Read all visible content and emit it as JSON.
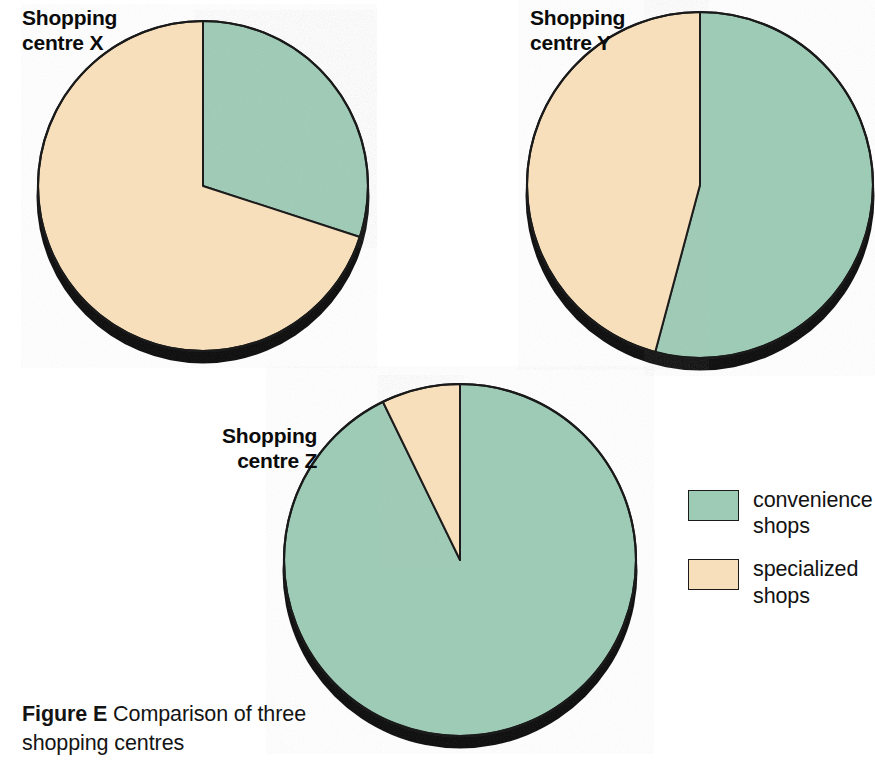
{
  "figure": {
    "caption_bold": "Figure E",
    "caption_rest": "  Comparison of three shopping centres"
  },
  "colors": {
    "convenience": "#9ecbb6",
    "specialized": "#f7dfbb",
    "outline": "#1a1a1a",
    "shadow": "#0a0a0a",
    "background": "#ffffff",
    "text": "#111111"
  },
  "legend": {
    "position": "right",
    "items": [
      {
        "label": "convenience\nshops",
        "color_key": "convenience",
        "swatch_name": "convenience-shops-swatch"
      },
      {
        "label": "specialized\nshops",
        "color_key": "specialized",
        "swatch_name": "specialized-shops-swatch"
      }
    ]
  },
  "charts": {
    "x": {
      "title": "Shopping\ncentre X",
      "cx": 203,
      "cy": 186,
      "r": 165,
      "shadow_dy": 11,
      "slices": [
        {
          "name": "convenience shops",
          "value": 30,
          "color_key": "convenience",
          "start_deg": 0,
          "end_deg": 108
        },
        {
          "name": "specialized shops",
          "value": 70,
          "color_key": "specialized",
          "start_deg": 108,
          "end_deg": 360
        }
      ]
    },
    "y": {
      "title": "Shopping\ncentre Y",
      "cx": 700,
      "cy": 185,
      "r": 173,
      "shadow_dy": 11,
      "slices": [
        {
          "name": "convenience shops",
          "value": 54,
          "color_key": "convenience",
          "start_deg": 0,
          "end_deg": 195
        },
        {
          "name": "specialized shops",
          "value": 46,
          "color_key": "specialized",
          "start_deg": 195,
          "end_deg": 360
        }
      ]
    },
    "z": {
      "title": "Shopping\ncentre Z",
      "cx": 460,
      "cy": 560,
      "r": 176,
      "shadow_dy": 11,
      "slices": [
        {
          "name": "convenience shops",
          "value": 93,
          "color_key": "convenience",
          "start_deg": 0,
          "end_deg": 334
        },
        {
          "name": "specialized shops",
          "value": 7,
          "color_key": "specialized",
          "start_deg": 334,
          "end_deg": 360
        }
      ]
    }
  },
  "chart_data": {
    "type": "pie",
    "title": "Figure E  Comparison of three shopping centres",
    "xlabel": "",
    "ylabel": "",
    "legend": [
      "convenience shops",
      "specialized shops"
    ],
    "legend_position": "right",
    "grid": false,
    "units": "percent of shops",
    "charts": [
      {
        "name": "Shopping centre X",
        "labels": [
          "convenience shops",
          "specialized shops"
        ],
        "values": [
          30,
          70
        ],
        "colors": [
          "#9ecbb6",
          "#f7dfbb"
        ],
        "start_angle_deg": 0,
        "direction": "clockwise"
      },
      {
        "name": "Shopping centre Y",
        "labels": [
          "convenience shops",
          "specialized shops"
        ],
        "values": [
          54,
          46
        ],
        "colors": [
          "#9ecbb6",
          "#f7dfbb"
        ],
        "start_angle_deg": 0,
        "direction": "clockwise"
      },
      {
        "name": "Shopping centre Z",
        "labels": [
          "convenience shops",
          "specialized shops"
        ],
        "values": [
          93,
          7
        ],
        "colors": [
          "#9ecbb6",
          "#f7dfbb"
        ],
        "start_angle_deg": 0,
        "direction": "clockwise"
      }
    ]
  }
}
